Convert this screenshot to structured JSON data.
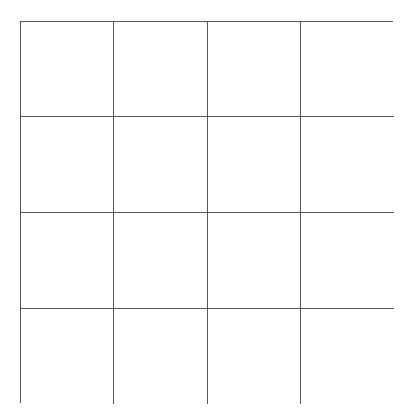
{
  "board": {
    "rows": 4,
    "cols": 4,
    "cells": [
      [
        "",
        "",
        "",
        ""
      ],
      [
        "",
        "",
        "",
        ""
      ],
      [
        "",
        "",
        "",
        ""
      ],
      [
        "",
        "",
        "",
        ""
      ]
    ]
  }
}
